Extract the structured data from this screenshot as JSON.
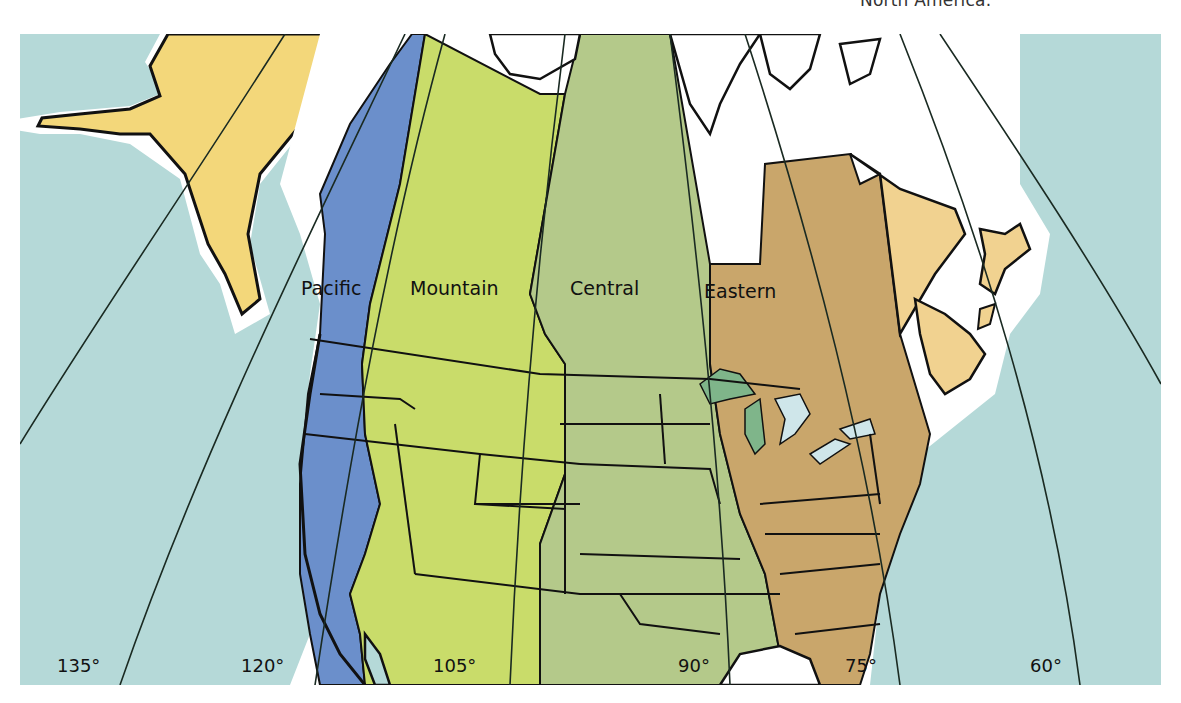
{
  "caption": "North America.",
  "map": {
    "colors": {
      "ocean": "#b5d9d8",
      "coast_halo": "#ffffff",
      "alaska": "#f3d77a",
      "pacific": "#6b8fcb",
      "mountain": "#c9dc6a",
      "central": "#b4c98a",
      "eastern": "#c9a66b",
      "atlantic": "#f1d290",
      "great_lakes": "#cfe6ea",
      "lake_shade": "#7fb58a",
      "border": "#111111"
    },
    "time_zones": [
      {
        "label": "Pacific"
      },
      {
        "label": "Mountain"
      },
      {
        "label": "Central"
      },
      {
        "label": "Eastern"
      }
    ],
    "meridians": [
      {
        "label": "135°"
      },
      {
        "label": "120°"
      },
      {
        "label": "105°"
      },
      {
        "label": "90°"
      },
      {
        "label": "75°"
      },
      {
        "label": "60°"
      }
    ]
  }
}
